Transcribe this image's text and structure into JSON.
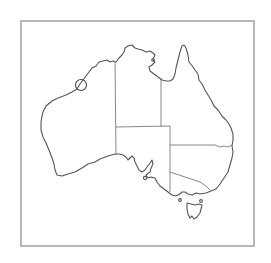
{
  "map": {
    "subject": "Australia outline map",
    "frame_color": "#b8b8b8",
    "coast_color": "#555555",
    "regions": [
      {
        "name": "Western Australia"
      },
      {
        "name": "Northern Territory"
      },
      {
        "name": "Queensland"
      },
      {
        "name": "South Australia"
      },
      {
        "name": "New South Wales"
      },
      {
        "name": "Victoria"
      },
      {
        "name": "Tasmania"
      }
    ],
    "marker": {
      "shape": "circle",
      "location_description": "Pilbara / north-west coast of Western Australia"
    }
  }
}
